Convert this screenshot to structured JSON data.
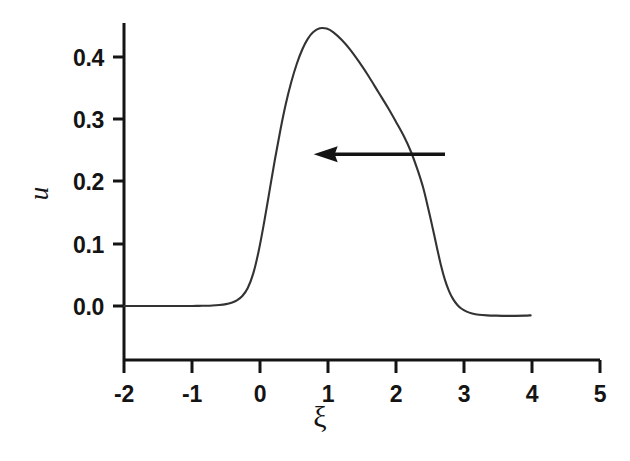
{
  "figure": {
    "background": "#ffffff",
    "ink_color": "#141414",
    "curve_color": "#333333"
  },
  "axes": {
    "x_title": "ξ",
    "y_title": "u",
    "x_ticks": [
      "-2",
      "-1",
      "0",
      "1",
      "2",
      "3",
      "4",
      "5"
    ],
    "y_ticks": [
      "0.4",
      "0.3",
      "0.2",
      "0.1",
      "0.0"
    ]
  },
  "annotations": [
    {
      "name": "leftward-arrow",
      "kind": "arrow",
      "direction": "left",
      "x_start": 2.72,
      "x_end": 0.79,
      "y_value": 0.244
    }
  ],
  "chart_data": {
    "type": "line",
    "title": "",
    "subtitle": "",
    "xlabel": "ξ",
    "ylabel": "u",
    "xlim": [
      -2,
      5
    ],
    "ylim": [
      -0.079,
      0.488
    ],
    "grid": false,
    "legend": null,
    "xticks": [
      -2,
      -1,
      0,
      1,
      2,
      3,
      4,
      5
    ],
    "yticks": [
      0.0,
      0.1,
      0.2,
      0.3,
      0.4
    ],
    "series": [
      {
        "name": "u(ξ)",
        "x": [
          -2.0,
          -1.8,
          -1.6,
          -1.4,
          -1.2,
          -1.0,
          -0.9,
          -0.8,
          -0.7,
          -0.6,
          -0.5,
          -0.42,
          -0.34,
          -0.26,
          -0.18,
          -0.1,
          -0.02,
          0.06,
          0.14,
          0.22,
          0.3,
          0.38,
          0.46,
          0.54,
          0.62,
          0.7,
          0.78,
          0.88,
          0.98,
          1.08,
          1.2,
          1.32,
          1.46,
          1.6,
          1.74,
          1.88,
          2.0,
          2.12,
          2.22,
          2.32,
          2.4,
          2.48,
          2.54,
          2.6,
          2.66,
          2.72,
          2.78,
          2.84,
          2.9,
          2.96,
          3.04,
          3.12,
          3.22,
          3.34,
          3.48,
          3.62,
          3.76,
          3.9,
          3.98
        ],
        "y": [
          0.0,
          0.0,
          0.0,
          0.0,
          0.0,
          0.0,
          0.0002,
          0.0004,
          0.0008,
          0.0016,
          0.003,
          0.0052,
          0.009,
          0.016,
          0.029,
          0.052,
          0.088,
          0.134,
          0.185,
          0.236,
          0.283,
          0.325,
          0.36,
          0.389,
          0.412,
          0.429,
          0.44,
          0.4465,
          0.446,
          0.44,
          0.428,
          0.413,
          0.392,
          0.369,
          0.344,
          0.319,
          0.296,
          0.272,
          0.248,
          0.218,
          0.19,
          0.154,
          0.125,
          0.095,
          0.066,
          0.042,
          0.024,
          0.011,
          0.002,
          -0.004,
          -0.009,
          -0.012,
          -0.014,
          -0.015,
          -0.0155,
          -0.0158,
          -0.0158,
          -0.0155,
          -0.015
        ]
      }
    ]
  },
  "geometry": {
    "plot_left_px": 124,
    "plot_right_px": 600,
    "px_per_x_unit": 68,
    "y_zero_px": 306,
    "px_per_0p1_u": 62.2,
    "x_axis_line_px": 360,
    "y_axis_top_px": 23
  }
}
